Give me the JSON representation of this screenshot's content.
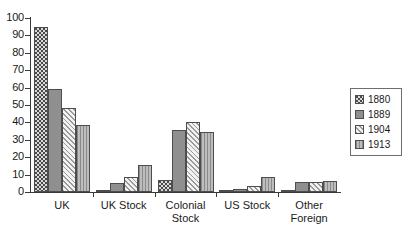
{
  "chart_data": {
    "type": "bar",
    "title": "",
    "subtitle": "",
    "xlabel": "",
    "ylabel": "",
    "ylim": [
      0,
      100
    ],
    "ytick_step": 10,
    "yticks": [
      0,
      10,
      20,
      30,
      40,
      50,
      60,
      70,
      80,
      90,
      100
    ],
    "ytick_labels": [
      "0",
      "10",
      "20",
      "30",
      "40",
      "50",
      "60",
      "70",
      "80",
      "90",
      "100"
    ],
    "grid": false,
    "legend_position": "right",
    "categories": [
      "UK",
      "UK Stock",
      "Colonial Stock",
      "US Stock",
      "Other Foreign"
    ],
    "category_labels": [
      "UK",
      "UK Stock",
      "Colonial\nStock",
      "US Stock",
      "Other\nForeign"
    ],
    "series": [
      {
        "name": "1880",
        "pattern": "dark-checkerboard",
        "color": "#4a4a4a",
        "values": [
          95,
          0.5,
          7,
          0.5,
          0.5
        ]
      },
      {
        "name": "1889",
        "pattern": "solid-gray",
        "color": "#8f8f8f",
        "values": [
          59,
          5,
          35.5,
          1.5,
          5.5
        ]
      },
      {
        "name": "1904",
        "pattern": "diagonal-hatch",
        "color": "#efefef",
        "values": [
          48.5,
          8.5,
          40.5,
          3.5,
          5.5
        ]
      },
      {
        "name": "1913",
        "pattern": "vertical-lines",
        "color": "#a6a6a6",
        "values": [
          38.5,
          15.5,
          34.5,
          8.5,
          6.5
        ]
      }
    ]
  },
  "legend": {
    "entries": [
      {
        "label": "1880"
      },
      {
        "label": "1889"
      },
      {
        "label": "1904"
      },
      {
        "label": "1913"
      }
    ]
  },
  "axis": {
    "y_max_label": "100",
    "y_min_label": "0"
  }
}
